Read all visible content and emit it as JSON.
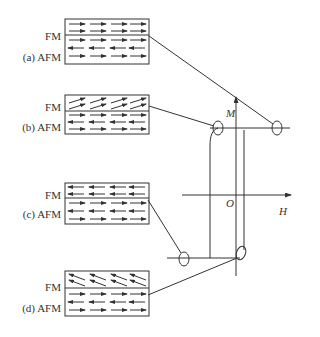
{
  "panels": [
    {
      "id": "a",
      "fm_label": "FM",
      "afm_label": "(a) AFM",
      "fm_direction": "right",
      "afm_rows": [
        "right",
        "left",
        "right"
      ],
      "loop_point": "positive-saturation"
    },
    {
      "id": "b",
      "fm_label": "FM",
      "afm_label": "(b) AFM",
      "fm_direction": "up-right-tilted",
      "afm_rows": [
        "right",
        "left",
        "right"
      ],
      "loop_point": "descending-branch-knee"
    },
    {
      "id": "c",
      "fm_label": "FM",
      "afm_label": "(c) AFM",
      "fm_direction": "left",
      "afm_rows": [
        "right",
        "left",
        "right"
      ],
      "loop_point": "negative-saturation"
    },
    {
      "id": "d",
      "fm_label": "FM",
      "afm_label": "(d) AFM",
      "fm_direction": "up-left-tilted",
      "afm_rows": [
        "right",
        "left",
        "right"
      ],
      "loop_point": "ascending-branch-knee"
    }
  ],
  "axes": {
    "y_label": "M",
    "x_label": "H",
    "origin_label": "O"
  },
  "colors": {
    "line": "#333333",
    "background": "#ffffff"
  }
}
